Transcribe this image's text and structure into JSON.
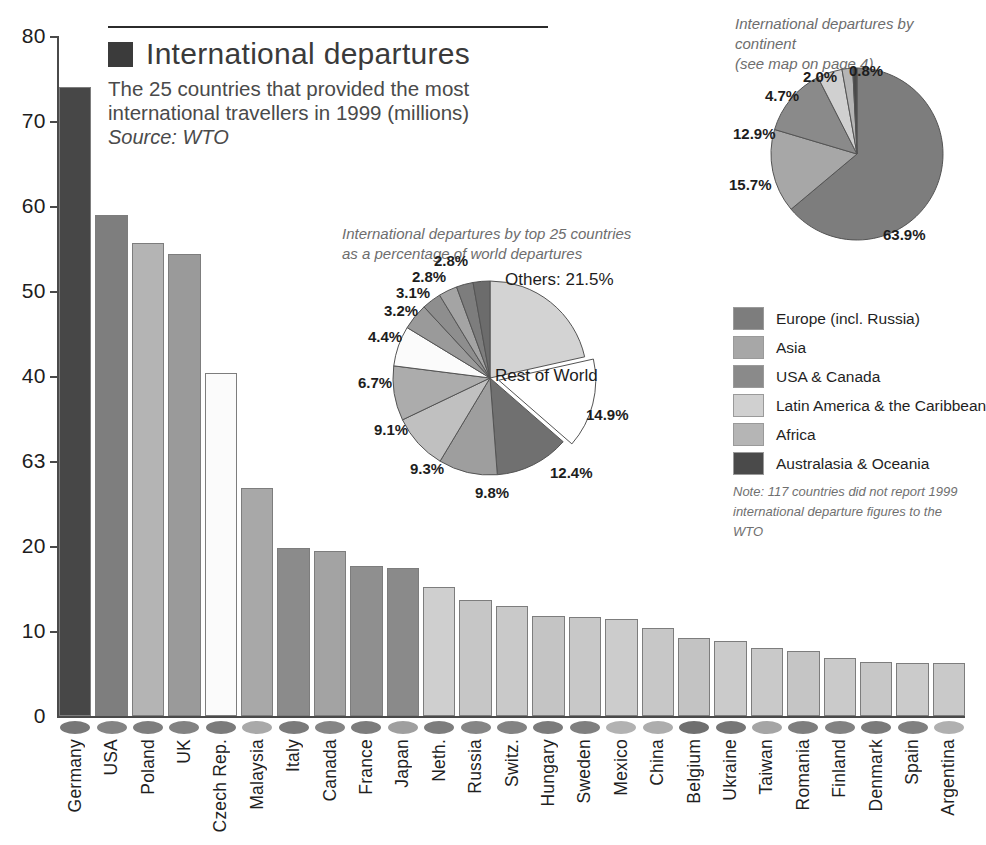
{
  "title": {
    "swatch_color": "#3b3b3b",
    "main": "International departures",
    "sub_line1": "The 25 countries that provided the most",
    "sub_line2": "international travellers in 1999 (millions)",
    "source": "Source: WTO"
  },
  "chart_data": [
    {
      "type": "bar",
      "title": "International departures",
      "subtitle": "The 25 countries that provided the most international travellers in 1999 (millions)",
      "source": "Source: WTO",
      "xlabel": "",
      "ylabel": "",
      "ylim": [
        0,
        80
      ],
      "yticks": [
        "80",
        "70",
        "60",
        "50",
        "40",
        "63",
        "20",
        "10",
        "0"
      ],
      "ytick_values": [
        80,
        70,
        60,
        50,
        40,
        30,
        20,
        10,
        0
      ],
      "grid": false,
      "categories": [
        "Germany",
        "USA",
        "Poland",
        "UK",
        "Czech Rep.",
        "Malaysia",
        "Italy",
        "Canada",
        "France",
        "Japan",
        "Neth.",
        "Russia",
        "Switz.",
        "Hungary",
        "Sweden",
        "Mexico",
        "China",
        "Belgium",
        "Ukraine",
        "Taiwan",
        "Romania",
        "Finland",
        "Denmark",
        "Spain",
        "Argentina"
      ],
      "values": [
        74.0,
        59.0,
        55.7,
        54.4,
        40.4,
        26.8,
        19.8,
        19.4,
        17.7,
        17.4,
        15.2,
        13.7,
        13.0,
        11.8,
        11.6,
        11.4,
        10.4,
        9.2,
        8.8,
        8.0,
        7.6,
        6.8,
        6.3,
        6.2,
        6.2
      ],
      "bar_colors": [
        "#474747",
        "#7e7e7e",
        "#b4b4b4",
        "#9a9a9a",
        "#fbfbfb",
        "#a8a8a8",
        "#8b8b8b",
        "#a3a3a3",
        "#8f8f8f",
        "#8a8a8a",
        "#cfcfcf",
        "#c6c6c6",
        "#c9c9c9",
        "#c4c4c4",
        "#c8c8c8",
        "#cccccc",
        "#c7c7c7",
        "#c3c3c3",
        "#cbcbcb",
        "#c9c9c9",
        "#c5c5c5",
        "#cacaca",
        "#c7c7c7",
        "#cbcbcb",
        "#c9c9c9"
      ],
      "marker_colors": [
        "#777777",
        "#848484",
        "#7e7e7e",
        "#828282",
        "#7b7b7b",
        "#a9a9a9",
        "#7a7a7a",
        "#858585",
        "#7c7c7c",
        "#9f9f9f",
        "#7d7d7d",
        "#858585",
        "#838383",
        "#7b7b7b",
        "#7f7f7f",
        "#b2b2b2",
        "#adadad",
        "#6f6f6f",
        "#767676",
        "#a5a5a5",
        "#7e7e7e",
        "#828282",
        "#7a7a7a",
        "#808080",
        "#b0b0b0"
      ]
    },
    {
      "type": "pie",
      "title": "International departures by top 25 countries as a percentage of world departures",
      "caption_line1": "International departures by top 25 countries",
      "caption_line2": "as a percentage of world departures",
      "labels": [
        "Others: 21.5%",
        "Rest of World",
        "12.4%",
        "9.8%",
        "9.3%",
        "9.1%",
        "6.7%",
        "4.4%",
        "3.2%",
        "3.1%",
        "2.8%",
        "2.8%"
      ],
      "values": [
        21.5,
        14.9,
        12.4,
        9.8,
        9.3,
        9.1,
        6.7,
        4.4,
        3.2,
        3.1,
        2.8,
        2.8
      ],
      "value_labels": [
        "21.5%",
        "14.9%",
        "12.4%",
        "9.8%",
        "9.3%",
        "9.1%",
        "6.7%",
        "4.4%",
        "3.2%",
        "3.1%",
        "2.8%",
        "2.8%"
      ],
      "slice_colors": [
        "#d3d3d3",
        "#ffffff",
        "#707070",
        "#9e9e9e",
        "#c0c0c0",
        "#acacac",
        "#fbfbfb",
        "#9a9a9a",
        "#8e8e8e",
        "#a4a4a4",
        "#7d7d7d",
        "#6c6c6c"
      ],
      "exploded_label": "Rest of World",
      "exploded_value_label": "14.9%",
      "others_label": "Others: 21.5%"
    },
    {
      "type": "pie",
      "title": "International departures by continent",
      "caption_line1": "International departures by continent",
      "caption_line2": "(see map on page 4)",
      "labels": [
        "Europe (incl. Russia)",
        "Asia",
        "USA & Canada",
        "Latin America & the Caribbean",
        "Africa",
        "Australasia & Oceania"
      ],
      "values": [
        63.9,
        15.7,
        12.9,
        4.7,
        2.0,
        0.8
      ],
      "value_labels": [
        "63.9%",
        "15.7%",
        "12.9%",
        "4.7%",
        "2.0%",
        "0.8%"
      ],
      "slice_colors": [
        "#7d7d7d",
        "#a7a7a7",
        "#8a8a8a",
        "#d0d0d0",
        "#b5b5b5",
        "#4a4a4a"
      ]
    }
  ],
  "legend": {
    "position": "right",
    "items": [
      {
        "label": "Europe (incl. Russia)",
        "color": "#7d7d7d"
      },
      {
        "label": "Asia",
        "color": "#a7a7a7"
      },
      {
        "label": "USA & Canada",
        "color": "#8a8a8a"
      },
      {
        "label": "Latin America & the Caribbean",
        "color": "#d0d0d0"
      },
      {
        "label": "Africa",
        "color": "#b5b5b5"
      },
      {
        "label": "Australasia & Oceania",
        "color": "#4a4a4a"
      }
    ],
    "note_line1": "Note: 117 countries did not report 1999",
    "note_line2": "international departure figures to the WTO"
  }
}
